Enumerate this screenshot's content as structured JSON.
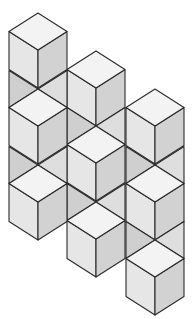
{
  "title": "Isometric cube arrangement",
  "geometry": {
    "half_width": 29,
    "diamond_half_height": 18.5,
    "edge_height": 38,
    "width": 194,
    "height": 319
  },
  "colors": {
    "background": "#ffffff",
    "top_face": "#f3f3f3",
    "left_face": "#e6e6e6",
    "right_face": "#d2d2d2",
    "connector_left": "#cfcfcf",
    "connector_right": "#dedede",
    "stroke": "#2a2a2a"
  },
  "columns": [
    {
      "name": "right-column",
      "center_x": 155,
      "cube_tops": [
        89,
        165,
        240
      ]
    },
    {
      "name": "middle-column",
      "center_x": 96,
      "cube_tops": [
        51,
        126,
        202
      ]
    },
    {
      "name": "left-column",
      "center_x": 38,
      "cube_tops": [
        13,
        89,
        165
      ]
    }
  ]
}
